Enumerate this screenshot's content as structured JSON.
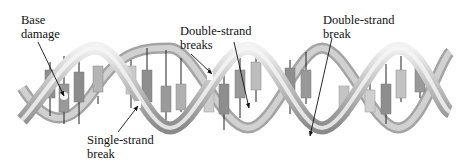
{
  "diagram": {
    "colors": {
      "background": "#ffffff",
      "backbone_light": "#e6e6e6",
      "backbone_dark": "#8a8a8a",
      "base_dark": "#8c8c8c",
      "base_light": "#c9c9c9",
      "text": "#111111",
      "arrow": "#111111"
    },
    "labels": [
      {
        "id": "base-damage",
        "lines": [
          "Base",
          "damage"
        ],
        "x": 21,
        "y": 13
      },
      {
        "id": "double-strand-breaks",
        "lines": [
          "Double-strand",
          "breaks"
        ],
        "x": 180,
        "y": 24
      },
      {
        "id": "double-strand-break",
        "lines": [
          "Double-strand",
          "break"
        ],
        "x": 323,
        "y": 13
      },
      {
        "id": "single-strand-break",
        "lines": [
          "Single-strand",
          "break"
        ],
        "x": 87,
        "y": 133
      }
    ],
    "arrows": [
      {
        "id": "arrow-base-damage",
        "x1": 38,
        "y1": 42,
        "x2": 64,
        "y2": 96
      },
      {
        "id": "arrow-double-strand-breaks-1",
        "x1": 191,
        "y1": 54,
        "x2": 212,
        "y2": 74
      },
      {
        "id": "arrow-double-strand-breaks-2",
        "x1": 234,
        "y1": 42,
        "x2": 249,
        "y2": 108
      },
      {
        "id": "arrow-double-strand-break",
        "x1": 332,
        "y1": 38,
        "x2": 308,
        "y2": 136
      },
      {
        "id": "arrow-single-strand-break",
        "x1": 118,
        "y1": 132,
        "x2": 138,
        "y2": 105
      }
    ]
  }
}
